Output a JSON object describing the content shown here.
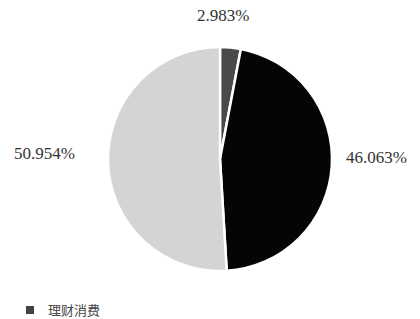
{
  "chart_data": {
    "type": "pie",
    "title": "",
    "slices": [
      {
        "label": "",
        "value": 2.983,
        "display": "2.983%",
        "color": "#4a4a4a"
      },
      {
        "label": "",
        "value": 46.063,
        "display": "46.063%",
        "color": "#050505"
      },
      {
        "label": "",
        "value": 50.954,
        "display": "50.954%",
        "color": "#d4d4d4"
      }
    ],
    "start_angle_deg": 0,
    "direction": "clockwise",
    "legend": {
      "position": "bottom-left",
      "entries": [
        "理财消费"
      ]
    }
  },
  "labels": {
    "top": "2.983%",
    "right": "46.063%",
    "left": "50.954%"
  },
  "legend": {
    "text": "理财消费"
  }
}
